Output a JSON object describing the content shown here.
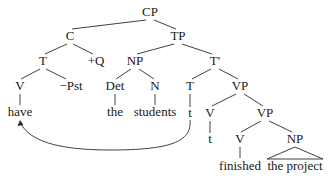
{
  "diagram": {
    "type": "syntax-tree",
    "nodes": {
      "cp": "CP",
      "c": "C",
      "tp": "TP",
      "c_t": "T",
      "q": "+Q",
      "np_subj": "NP",
      "tbar": "T'",
      "c_v": "V",
      "pst": "−Pst",
      "det": "Det",
      "n": "N",
      "t_head": "T",
      "vp1": "VP",
      "have": "have",
      "the": "the",
      "students": "students",
      "t_trace": "t",
      "v1": "V",
      "vp2": "VP",
      "v1_trace": "t",
      "v2": "V",
      "np_obj": "NP",
      "finished": "finished",
      "the_project": "the project"
    },
    "movement_arrow": {
      "from": "t (under T)",
      "to": "have"
    }
  }
}
